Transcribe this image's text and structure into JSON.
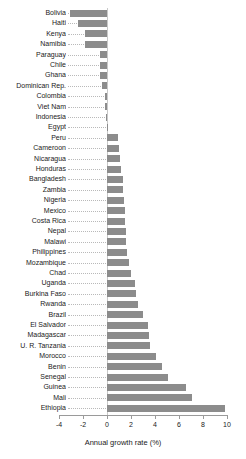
{
  "chart_data": {
    "type": "bar",
    "orientation": "horizontal",
    "title": "",
    "subtitle": "",
    "xlabel": "Annual growth rate (%)",
    "ylabel": "",
    "xlim": [
      -4,
      10
    ],
    "xticks": [
      -4,
      -2,
      0,
      2,
      4,
      6,
      8,
      10
    ],
    "xticklabels": [
      "-4",
      "-2",
      "0",
      "2",
      "4",
      "6",
      "8",
      "10"
    ],
    "grid": false,
    "legend": null,
    "bar_color": "#8c8c8c",
    "zero_reference_line": true,
    "leader_lines": "dotted",
    "categories": [
      "Bolivia",
      "Haiti",
      "Kenya",
      "Namibia",
      "Paraguay",
      "Chile",
      "Ghana",
      "Dominican Rep.",
      "Colombia",
      "Viet Nam",
      "Indonesia",
      "Egypt",
      "Peru",
      "Cameroon",
      "Nicaragua",
      "Honduras",
      "Bangladesh",
      "Zambia",
      "Nigeria",
      "Mexico",
      "Costa Rica",
      "Nepal",
      "Malawi",
      "Philippines",
      "Mozambique",
      "Chad",
      "Uganda",
      "Burkina Faso",
      "Rwanda",
      "Brazil",
      "El Salvador",
      "Madagascar",
      "U. R. Tanzania",
      "Morocco",
      "Benin",
      "Senegal",
      "Guinea",
      "Mali",
      "Ethiopia"
    ],
    "values": [
      -3.1,
      -2.4,
      -1.8,
      -1.8,
      -0.6,
      -0.6,
      -0.6,
      -0.4,
      -0.15,
      -0.15,
      -0.05,
      0.1,
      0.9,
      1.0,
      1.1,
      1.2,
      1.3,
      1.35,
      1.4,
      1.5,
      1.5,
      1.55,
      1.6,
      1.7,
      1.8,
      2.0,
      2.3,
      2.4,
      2.6,
      3.0,
      3.4,
      3.5,
      3.6,
      4.1,
      4.6,
      5.1,
      6.6,
      7.1,
      9.8
    ]
  },
  "axis": {
    "x_title": "Annual growth rate (%)"
  }
}
